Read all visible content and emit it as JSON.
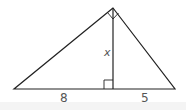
{
  "diagram": {
    "type": "right-triangle-with-altitude",
    "stroke_color": "#222222",
    "label_color": "#555555",
    "vertices": {
      "apex": [
        113,
        8
      ],
      "left": [
        14,
        89
      ],
      "right": [
        175,
        89
      ],
      "foot": [
        113,
        89
      ]
    },
    "labels": {
      "altitude": "x",
      "left_segment": "8",
      "right_segment": "5"
    },
    "right_angle_marks": [
      "apex",
      "foot"
    ]
  }
}
